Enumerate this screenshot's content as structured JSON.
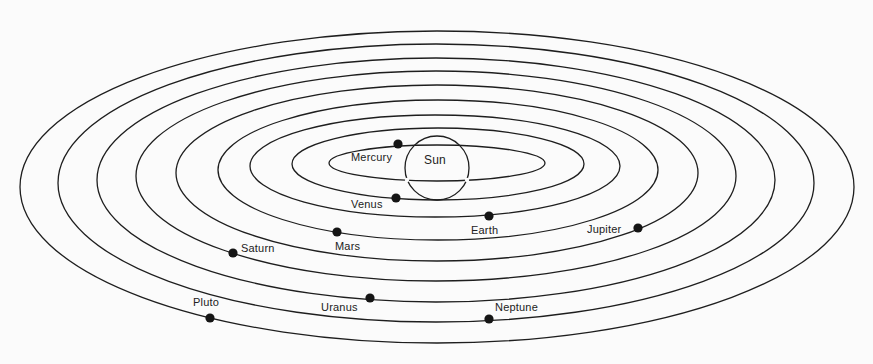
{
  "diagram": {
    "background": "#fbfbfb",
    "line_color": "#1e1e1e",
    "sun": {
      "label": "Sun",
      "cx": 437,
      "cy": 168,
      "r": 32
    },
    "orbits": [
      {
        "planet": "Mercury",
        "cx": 437,
        "cy": 163,
        "rx": 108,
        "ry": 18
      },
      {
        "planet": "Venus",
        "cx": 438,
        "cy": 164,
        "rx": 146,
        "ry": 36
      },
      {
        "planet": "Earth",
        "cx": 435,
        "cy": 166,
        "rx": 185,
        "ry": 51
      },
      {
        "planet": "Mars",
        "cx": 438,
        "cy": 170,
        "rx": 220,
        "ry": 70
      },
      {
        "planet": "Jupiter",
        "cx": 437,
        "cy": 173,
        "rx": 261,
        "ry": 88
      },
      {
        "planet": "Saturn",
        "cx": 436,
        "cy": 176,
        "rx": 300,
        "ry": 105
      },
      {
        "planet": "Uranus",
        "cx": 436,
        "cy": 180,
        "rx": 339,
        "ry": 122
      },
      {
        "planet": "Neptune",
        "cx": 436,
        "cy": 183,
        "rx": 378,
        "ry": 139
      },
      {
        "planet": "Pluto",
        "cx": 437,
        "cy": 187,
        "rx": 417,
        "ry": 156
      }
    ],
    "planets": [
      {
        "name": "Mercury",
        "x": 398,
        "y": 144,
        "label_x": 351,
        "label_y": 152
      },
      {
        "name": "Venus",
        "x": 396,
        "y": 198,
        "label_x": 351,
        "label_y": 199
      },
      {
        "name": "Earth",
        "x": 489,
        "y": 216,
        "label_x": 471,
        "label_y": 225
      },
      {
        "name": "Mars",
        "x": 337,
        "y": 232,
        "label_x": 335,
        "label_y": 241
      },
      {
        "name": "Jupiter",
        "x": 638,
        "y": 228,
        "label_x": 587,
        "label_y": 224
      },
      {
        "name": "Saturn",
        "x": 233,
        "y": 253,
        "label_x": 241,
        "label_y": 243
      },
      {
        "name": "Uranus",
        "x": 370,
        "y": 298,
        "label_x": 321,
        "label_y": 302
      },
      {
        "name": "Neptune",
        "x": 489,
        "y": 319,
        "label_x": 495,
        "label_y": 302
      },
      {
        "name": "Pluto",
        "x": 210,
        "y": 318,
        "label_x": 193,
        "label_y": 297
      }
    ]
  }
}
